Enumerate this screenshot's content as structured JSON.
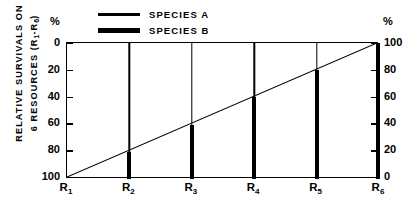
{
  "legend": {
    "items": [
      {
        "label": "SPECIES A",
        "style": "thin",
        "color": "#000000"
      },
      {
        "label": "SPECIES B",
        "style": "thick",
        "color": "#000000"
      }
    ]
  },
  "axes": {
    "y_caption_line1": "RELATIVE SURVIVALS ON",
    "y_caption_line2_pre": "6 RESOURCES (R",
    "y_caption_line2_sub1": "1",
    "y_caption_line2_mid": "-R",
    "y_caption_line2_sub2": "6",
    "y_caption_line2_post": ")",
    "left_unit": "%",
    "right_unit": "%",
    "left_ticks": [
      "0",
      "20",
      "40",
      "60",
      "80",
      "100"
    ],
    "right_ticks": [
      "100",
      "80",
      "60",
      "40",
      "20",
      "0"
    ],
    "x_ticks": [
      {
        "base": "R",
        "sub": "1"
      },
      {
        "base": "R",
        "sub": "2"
      },
      {
        "base": "R",
        "sub": "3"
      },
      {
        "base": "R",
        "sub": "4"
      },
      {
        "base": "R",
        "sub": "5"
      },
      {
        "base": "R",
        "sub": "6"
      }
    ]
  },
  "chart_data": {
    "type": "line",
    "title": "",
    "xlabel": "",
    "ylabel": "RELATIVE SURVIVALS ON 6 RESOURCES (R1-R6)",
    "categories": [
      "R1",
      "R2",
      "R3",
      "R4",
      "R5",
      "R6"
    ],
    "left_axis": {
      "label": "%",
      "ticks": [
        0,
        20,
        40,
        60,
        80,
        100
      ],
      "lim": [
        0,
        100
      ],
      "direction": "descending"
    },
    "right_axis": {
      "label": "%",
      "ticks": [
        100,
        80,
        60,
        40,
        20,
        0
      ],
      "lim": [
        0,
        100
      ],
      "direction": "descending"
    },
    "grid": false,
    "legend_position": "top-left",
    "series": [
      {
        "name": "SPECIES A",
        "style": "thin-line",
        "color": "#000000",
        "x": [
          "R1",
          "R2",
          "R3",
          "R4",
          "R5",
          "R6"
        ],
        "values_right_axis": [
          0,
          20,
          40,
          60,
          80,
          100
        ],
        "values_left_axis": [
          100,
          80,
          60,
          40,
          20,
          0
        ]
      },
      {
        "name": "SPECIES B",
        "style": "thick-vertical-bars",
        "color": "#000000",
        "x": [
          "R1",
          "R2",
          "R3",
          "R4",
          "R5",
          "R6"
        ],
        "values_right_axis": [
          0,
          20,
          40,
          60,
          80,
          100
        ],
        "values_left_axis": [
          100,
          80,
          60,
          40,
          20,
          0
        ]
      }
    ]
  }
}
